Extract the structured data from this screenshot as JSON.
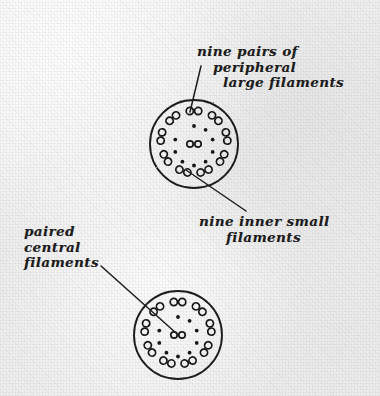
{
  "figure": {
    "medium": "handwritten pencil sketch on textured paper",
    "ink_color": "#1c1c1c",
    "paper_color": "#f0f0f0"
  },
  "labels": {
    "nine_pairs": {
      "line1": "nine pairs of",
      "line2": "peripheral",
      "line3": "large filaments"
    },
    "nine_inner": {
      "line1": "nine inner small",
      "line2": "filaments"
    },
    "paired_central": {
      "line1": "paired",
      "line2": "central",
      "line3": "filaments"
    }
  },
  "diagrams": [
    {
      "name": "upper-cross-section",
      "cx": 194,
      "cy": 144,
      "r": 44,
      "peripheral_doublet_count": 9,
      "inner_dot_count": 9,
      "central_pair_count": 2,
      "peripheral_ring_radius": 33,
      "inner_ring_radius": 18,
      "doublet_lobe_radius": 3.6,
      "inner_dot_radius": 1.9,
      "central_circle_radius": 3.2,
      "central_pair_gap": 8
    },
    {
      "name": "lower-cross-section",
      "cx": 178,
      "cy": 335,
      "r": 44,
      "peripheral_doublet_count": 9,
      "inner_dot_count": 9,
      "central_pair_count": 2,
      "peripheral_ring_radius": 33,
      "inner_ring_radius": 18,
      "doublet_lobe_radius": 3.6,
      "inner_dot_radius": 1.9,
      "central_circle_radius": 3.2,
      "central_pair_gap": 8
    }
  ],
  "leader_lines": [
    {
      "name": "leader-nine-pairs",
      "x1": 201,
      "y1": 66,
      "x2": 190,
      "y2": 112
    },
    {
      "name": "leader-nine-inner",
      "x1": 186,
      "y1": 170,
      "x2": 246,
      "y2": 211
    },
    {
      "name": "leader-paired-central",
      "x1": 101,
      "y1": 266,
      "x2": 176,
      "y2": 333
    }
  ]
}
